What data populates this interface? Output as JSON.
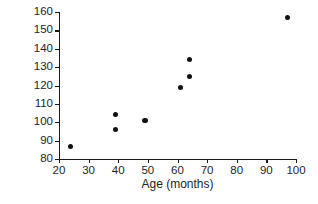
{
  "chart_data": {
    "type": "scatter",
    "title": "",
    "xlabel": "Age (months)",
    "ylabel": "Height (cm)",
    "xlim": [
      20,
      100
    ],
    "ylim": [
      80,
      160
    ],
    "xticks": [
      20,
      30,
      40,
      50,
      60,
      70,
      80,
      90,
      100
    ],
    "yticks": [
      80,
      90,
      100,
      110,
      120,
      130,
      140,
      150,
      160
    ],
    "xticklabels": [
      "20",
      "30",
      "40",
      "50",
      "60",
      "70",
      "80",
      "90",
      "100"
    ],
    "yticklabels": [
      "80",
      "90",
      "100",
      "110",
      "120",
      "130",
      "140",
      "150",
      "160"
    ],
    "grid": false,
    "legend": null,
    "marker": "filled-circle",
    "marker_color": "#111111",
    "x": [
      24,
      39,
      39,
      49,
      61,
      64,
      64,
      97
    ],
    "y": [
      87,
      104,
      96,
      101,
      119,
      125,
      134,
      157
    ],
    "points": [
      {
        "age": 24,
        "height": 87
      },
      {
        "age": 39,
        "height": 104
      },
      {
        "age": 39,
        "height": 96
      },
      {
        "age": 49,
        "height": 101
      },
      {
        "age": 61,
        "height": 119
      },
      {
        "age": 64,
        "height": 125
      },
      {
        "age": 64,
        "height": 134
      },
      {
        "age": 97,
        "height": 157
      }
    ]
  },
  "axis_color": "#1a1a1a",
  "background": "#ffffff"
}
